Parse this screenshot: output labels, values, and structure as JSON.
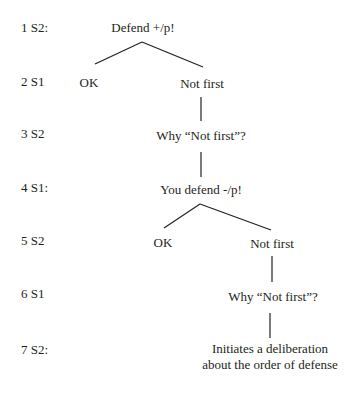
{
  "diagram": {
    "type": "dialogue-tree",
    "rows": [
      {
        "label": "1 S2:",
        "y": 20
      },
      {
        "label": "2 S1",
        "y": 74
      },
      {
        "label": "3 S2",
        "y": 126
      },
      {
        "label": "4 S1:",
        "y": 180
      },
      {
        "label": "5 S2",
        "y": 233
      },
      {
        "label": "6 S1",
        "y": 286
      },
      {
        "label": "7 S2:",
        "y": 342
      }
    ],
    "nodes": [
      {
        "id": "n1",
        "row": 1,
        "text": "Defend +/p!"
      },
      {
        "id": "n2a",
        "row": 2,
        "text": "OK"
      },
      {
        "id": "n2b",
        "row": 2,
        "text": "Not first"
      },
      {
        "id": "n3",
        "row": 3,
        "text": "Why “Not first”?"
      },
      {
        "id": "n4",
        "row": 4,
        "text": "You defend -/p!"
      },
      {
        "id": "n5a",
        "row": 5,
        "text": "OK"
      },
      {
        "id": "n5b",
        "row": 5,
        "text": "Not first"
      },
      {
        "id": "n6",
        "row": 6,
        "text": "Why “Not first”?"
      },
      {
        "id": "n7",
        "row": 7,
        "text_line1": "Initiates a deliberation",
        "text_line2": "about the order of defense"
      }
    ],
    "edges": [
      {
        "from": "n1",
        "to": "n2a"
      },
      {
        "from": "n1",
        "to": "n2b"
      },
      {
        "from": "n2b",
        "to": "n3"
      },
      {
        "from": "n3",
        "to": "n4"
      },
      {
        "from": "n4",
        "to": "n5a"
      },
      {
        "from": "n4",
        "to": "n5b"
      },
      {
        "from": "n5b",
        "to": "n6"
      },
      {
        "from": "n6",
        "to": "n7"
      }
    ]
  }
}
